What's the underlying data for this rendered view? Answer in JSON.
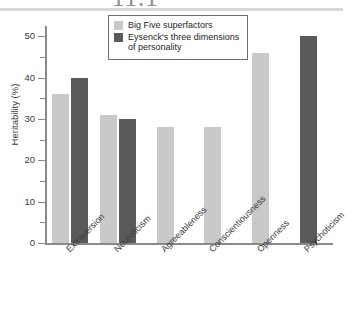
{
  "figure": {
    "number": "11.1"
  },
  "chart_data": {
    "type": "bar",
    "title": "",
    "xlabel": "",
    "ylabel": "Heritability (%)",
    "ylim": [
      0,
      52
    ],
    "yticks": [
      0,
      10,
      20,
      30,
      40,
      50
    ],
    "ytick_labels": [
      "0",
      "10",
      "20",
      "30",
      "40",
      "50"
    ],
    "yminor_ticks": [
      5,
      15,
      25,
      35,
      45
    ],
    "grid": false,
    "legend_position": "top-center",
    "categories": [
      "Extraversion",
      "Neuroticism",
      "Agreeableness",
      "Conscientiousness",
      "Openness",
      "Psychoticism"
    ],
    "series": [
      {
        "name": "Big Five superfactors",
        "color": "#c9c9c9",
        "values": [
          36,
          31,
          28,
          28,
          46,
          null
        ]
      },
      {
        "name": "Eysenck's three dimensions of personality",
        "color": "#5a5a5a",
        "values": [
          40,
          30,
          null,
          null,
          null,
          50
        ]
      }
    ]
  },
  "legend": {
    "items": [
      {
        "label": "Big Five superfactors",
        "swatch": "light"
      },
      {
        "label": "Eysenck's three dimensions of personality",
        "swatch": "dark"
      }
    ]
  }
}
